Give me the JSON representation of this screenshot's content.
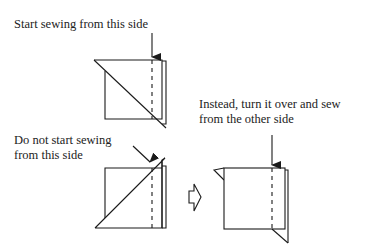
{
  "diagram": {
    "colors": {
      "line": "#1a1a1a",
      "text": "#222222",
      "background": "#ffffff"
    },
    "labels": {
      "correct": "Start sewing from this side",
      "wrong_line1": "Do not start sewing",
      "wrong_line2": "from this side",
      "instead_line1": "Instead, turn it over and sew",
      "instead_line2": "from the other side"
    },
    "figures": [
      {
        "id": "correct-unit",
        "description": "Square with diagonal seam running top-left to bottom-right, dashed stitch line near right edge, arrow pointing down at start"
      },
      {
        "id": "wrong-unit",
        "description": "Square with diagonal seam running bottom-left to top-right, dashed stitch line near right edge, diagonal arrow pointing to triangle tip"
      },
      {
        "id": "flipped-unit",
        "description": "Unit turned over; triangle flaps visible at top-left and bottom-right, dashed stitch line near right edge, arrow pointing down"
      }
    ],
    "connector": {
      "id": "turn-over-arrow",
      "shape": "hollow right-pointing block arrow"
    }
  }
}
